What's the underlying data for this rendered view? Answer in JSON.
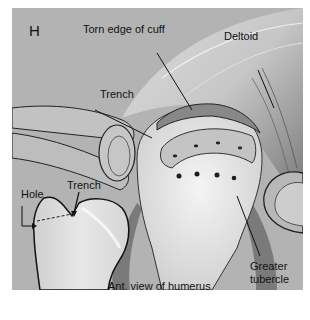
{
  "figure": {
    "panel_letter": "H",
    "background_color": "#b3b3b3",
    "labels": {
      "torn_edge": "Torn edge of cuff",
      "deltoid": "Deltoid",
      "trench_main": "Trench",
      "hole": "Hole",
      "trench_inset": "Trench",
      "ant_view": "Ant. view of humerus",
      "greater_tubercle_line1": "Greater",
      "greater_tubercle_line2": "tubercle"
    }
  }
}
